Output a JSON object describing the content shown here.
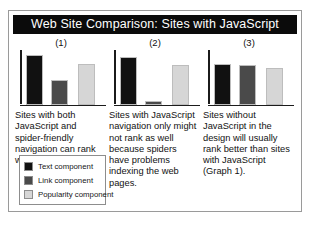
{
  "figure": {
    "title": "Web Site Comparison: Sites with JavaScript"
  },
  "chart_data": {
    "type": "bar",
    "title": "Web Site Comparison: Sites with JavaScript",
    "xlabel": "",
    "ylabel": "",
    "ylim": [
      0,
      100
    ],
    "grid": false,
    "legend_position": "bottom-left",
    "series": [
      {
        "name": "Text component",
        "color": "#111111",
        "values": [
          95,
          92,
          78
        ]
      },
      {
        "name": "Link component",
        "color": "#4a4a4a",
        "values": [
          48,
          6,
          76
        ]
      },
      {
        "name": "Popularity component",
        "color": "#d6d6d6",
        "values": [
          78,
          76,
          70
        ]
      }
    ],
    "panels": [
      {
        "label": "(1)",
        "caption": "Sites with both JavaScript and spider-friendly navigation can rank well.",
        "bars": [
          {
            "series": "Text component",
            "value": 95,
            "color": "#111111"
          },
          {
            "series": "Link component",
            "value": 48,
            "color": "#4a4a4a"
          },
          {
            "series": "Popularity component",
            "value": 78,
            "color": "#d6d6d6"
          }
        ]
      },
      {
        "label": "(2)",
        "caption": "Sites with JavaScript navigation only might not rank as well because spiders have problems indexing the web pages.",
        "bars": [
          {
            "series": "Text component",
            "value": 92,
            "color": "#111111"
          },
          {
            "series": "Link component",
            "value": 6,
            "color": "#4a4a4a"
          },
          {
            "series": "Popularity component",
            "value": 76,
            "color": "#d6d6d6"
          }
        ]
      },
      {
        "label": "(3)",
        "caption": "Sites without JavaScript in the design will usually rank better than sites with JavaScript (Graph 1).",
        "bars": [
          {
            "series": "Text component",
            "value": 78,
            "color": "#111111"
          },
          {
            "series": "Link component",
            "value": 76,
            "color": "#4a4a4a"
          },
          {
            "series": "Popularity component",
            "value": 70,
            "color": "#d6d6d6"
          }
        ]
      }
    ],
    "legend": [
      {
        "label": "Text component",
        "color": "#111111"
      },
      {
        "label": "Link component",
        "color": "#4a4a4a"
      },
      {
        "label": "Popularity component",
        "color": "#d6d6d6"
      }
    ]
  }
}
